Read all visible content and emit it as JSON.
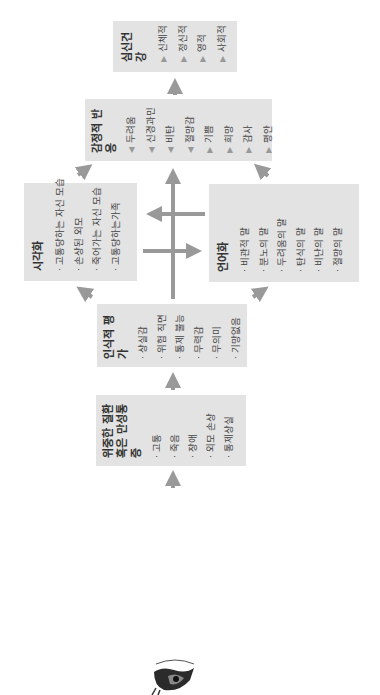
{
  "diagram": {
    "orientation": "rotated 90deg counter-clockwise",
    "start_icon": "eye-illustration",
    "boxes": {
      "illness": {
        "title": "위중한 질환\n혹은 만성통증",
        "items": [
          "고통",
          "죽음",
          "장애",
          "외모 손상",
          "통제상실"
        ]
      },
      "appraisal": {
        "title": "인식적 평가",
        "items": [
          "상실감",
          "위험 직면",
          "통제 불능",
          "무력감",
          "무의미",
          "기망없음"
        ]
      },
      "visualization": {
        "title": "시각화",
        "items": [
          "고통당하는 자신 모습",
          "손상된 외모",
          "죽어가는 자신 모습",
          "고통당하는가족"
        ]
      },
      "verbalization": {
        "title": "언어화",
        "items": [
          "비관적 말",
          "분노의 말",
          "두려움의 말",
          "탄식의 말",
          "비난의 말",
          "절망의 말"
        ]
      },
      "emotional": {
        "title": "감정적 반응",
        "items": [
          {
            "marker": "◀",
            "label": "두려움"
          },
          {
            "marker": "◀",
            "label": "신경과민"
          },
          {
            "marker": "◀",
            "label": "비탄"
          },
          {
            "marker": "◀",
            "label": "절망감"
          },
          {
            "marker": "▶",
            "label": "기쁨"
          },
          {
            "marker": "▶",
            "label": "희망"
          },
          {
            "marker": "▶",
            "label": "감사"
          },
          {
            "marker": "▶",
            "label": "평안"
          }
        ]
      },
      "health": {
        "title": "심신건강",
        "items": [
          {
            "marker": "▶",
            "label": "신체적"
          },
          {
            "marker": "▶",
            "label": "정신적"
          },
          {
            "marker": "▶",
            "label": "영적"
          },
          {
            "marker": "▶",
            "label": "사회적"
          }
        ]
      }
    },
    "colors": {
      "box": "#e3e3e3",
      "arrow": "#999999",
      "text": "#333333"
    }
  }
}
